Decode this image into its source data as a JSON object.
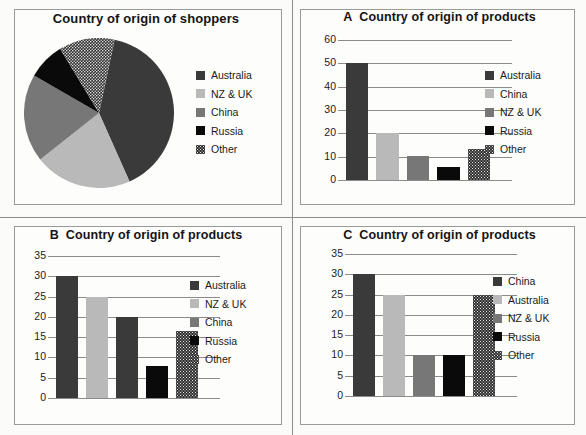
{
  "colors": {
    "australia": "#3a3a3a",
    "nz_uk": "#b9b9b9",
    "china": "#777777",
    "russia": "#0a0a0a",
    "other": "#2f2f2f",
    "gridline": "#8b8b8b",
    "frame_border": "#9a9a9a",
    "page_background": "#fbfbfa"
  },
  "panels": {
    "pie": {
      "title": "Country of origin of shoppers",
      "legend": [
        {
          "label": "Australia",
          "fill": "f-dark"
        },
        {
          "label": "NZ & UK",
          "fill": "f-light"
        },
        {
          "label": "China",
          "fill": "f-mid"
        },
        {
          "label": "Russia",
          "fill": "f-black"
        },
        {
          "label": "Other",
          "fill": "f-dot"
        }
      ]
    },
    "a": {
      "lead": "A",
      "title": "Country of origin of products",
      "legend": [
        {
          "label": "Australia",
          "fill": "f-dark"
        },
        {
          "label": "China",
          "fill": "f-light"
        },
        {
          "label": "NZ & UK",
          "fill": "f-mid"
        },
        {
          "label": "Russia",
          "fill": "f-black"
        },
        {
          "label": "Other",
          "fill": "f-dot"
        }
      ]
    },
    "b": {
      "lead": "B",
      "title": "Country of origin of products",
      "legend": [
        {
          "label": "Australia",
          "fill": "f-dark"
        },
        {
          "label": "NZ & UK",
          "fill": "f-light"
        },
        {
          "label": "China",
          "fill": "f-mid"
        },
        {
          "label": "Russia",
          "fill": "f-black"
        },
        {
          "label": "Other",
          "fill": "f-dot"
        }
      ]
    },
    "c": {
      "lead": "C",
      "title": "Country of origin of products",
      "legend": [
        {
          "label": "China",
          "fill": "f-dark"
        },
        {
          "label": "Australia",
          "fill": "f-light"
        },
        {
          "label": "NZ & UK",
          "fill": "f-mid"
        },
        {
          "label": "Russia",
          "fill": "f-black"
        },
        {
          "label": "Other",
          "fill": "f-dot"
        }
      ]
    }
  },
  "chart_data": [
    {
      "id": "pie",
      "type": "pie",
      "title": "Country of origin of shoppers",
      "labels": [
        "Australia",
        "NZ & UK",
        "China",
        "Russia",
        "Other"
      ],
      "values": [
        40,
        21,
        19,
        8,
        12
      ],
      "unit": "percent",
      "start_angle_deg": 12,
      "direction": "clockwise",
      "legend_position": "right",
      "colors": [
        "#3a3a3a",
        "#b9b9b9",
        "#777777",
        "#0a0a0a",
        "#2f2f2f"
      ],
      "patterns": [
        "solid",
        "solid",
        "solid",
        "solid",
        "dotted"
      ]
    },
    {
      "id": "a",
      "type": "bar",
      "title": "A  Country of origin of products",
      "categories": [
        "Australia",
        "China",
        "NZ & UK",
        "Russia",
        "Other"
      ],
      "values": [
        50,
        20,
        10.5,
        5.5,
        13.5
      ],
      "xlabel": "",
      "ylabel": "",
      "ylim": [
        0,
        60
      ],
      "yticks": [
        0,
        10,
        20,
        30,
        40,
        50,
        60
      ],
      "grid": true,
      "legend_position": "right",
      "colors": [
        "#3a3a3a",
        "#b9b9b9",
        "#777777",
        "#0a0a0a",
        "#2f2f2f"
      ],
      "patterns": [
        "solid",
        "solid",
        "solid",
        "solid",
        "dotted"
      ]
    },
    {
      "id": "b",
      "type": "bar",
      "title": "B  Country of origin of products",
      "categories": [
        "Australia",
        "NZ & UK",
        "China",
        "Russia",
        "Other"
      ],
      "values": [
        30,
        25,
        20,
        8,
        16.5
      ],
      "xlabel": "",
      "ylabel": "",
      "ylim": [
        0,
        35
      ],
      "yticks": [
        0,
        5,
        10,
        15,
        20,
        25,
        30,
        35
      ],
      "grid": true,
      "legend_position": "right",
      "colors": [
        "#3a3a3a",
        "#b9b9b9",
        "#3a3a3a",
        "#0a0a0a",
        "#2f2f2f"
      ],
      "patterns": [
        "solid",
        "solid",
        "solid",
        "solid",
        "dotted"
      ]
    },
    {
      "id": "c",
      "type": "bar",
      "title": "C  Country of origin of products",
      "categories": [
        "China",
        "Australia",
        "NZ & UK",
        "Russia",
        "Other"
      ],
      "values": [
        30,
        25,
        10,
        10,
        25
      ],
      "xlabel": "",
      "ylabel": "",
      "ylim": [
        0,
        35
      ],
      "yticks": [
        0,
        5,
        10,
        15,
        20,
        25,
        30,
        35
      ],
      "grid": true,
      "legend_position": "right",
      "colors": [
        "#3a3a3a",
        "#b9b9b9",
        "#777777",
        "#0a0a0a",
        "#2f2f2f"
      ],
      "patterns": [
        "solid",
        "solid",
        "solid",
        "solid",
        "dotted"
      ]
    }
  ]
}
